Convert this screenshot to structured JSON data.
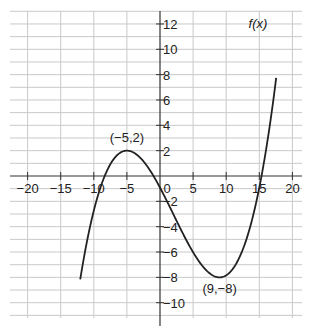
{
  "chart_data": {
    "type": "line",
    "title": "",
    "xlabel": "",
    "ylabel": "",
    "xlim": [
      -22,
      21
    ],
    "ylim": [
      -13.3,
      12.9
    ],
    "grid": true,
    "x_ticks": [
      -20,
      -15,
      -10,
      -5,
      0,
      5,
      10,
      15,
      20
    ],
    "x_tick_labels": [
      "−20",
      "−15",
      "−10",
      "−5",
      "0",
      "5",
      "10",
      "15",
      "20"
    ],
    "y_ticks": [
      -10,
      -8,
      -6,
      -4,
      -2,
      2,
      4,
      6,
      8,
      10,
      12
    ],
    "y_tick_labels": [
      "−10",
      "−8",
      "−6",
      "−4",
      "−2",
      "2",
      "4",
      "6",
      "8",
      "10",
      "12"
    ],
    "series": [
      {
        "name": "f(x)",
        "description": "cubic with local maximum at (-5,2) and local minimum at (9,-8)",
        "x": [
          -12,
          -10,
          -8,
          -5,
          -2,
          0,
          2,
          5,
          7,
          9,
          11,
          13,
          15,
          16,
          17
        ],
        "values": [
          -11.0,
          -3.8,
          0.5,
          2.0,
          0.5,
          -0.9,
          -2.8,
          -5.9,
          -7.5,
          -8.0,
          -7.6,
          -5.6,
          -1.5,
          1.6,
          5.5
        ]
      }
    ],
    "annotations": [
      {
        "text": "(−5,2)",
        "x": -5,
        "y": 2
      },
      {
        "text": "(9,−8)",
        "x": 9,
        "y": -8
      },
      {
        "text": "f(x)",
        "x": 14,
        "y": 12
      }
    ]
  }
}
